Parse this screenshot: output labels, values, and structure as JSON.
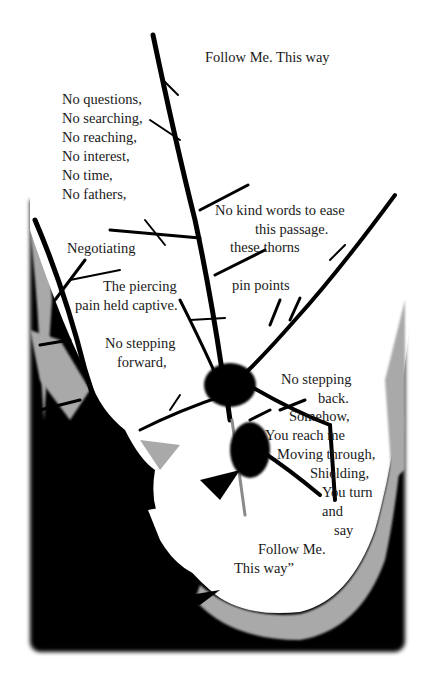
{
  "poem": {
    "title_line": "Follow Me. This way",
    "stanza_left": [
      "No questions,",
      "No searching,",
      "No reaching,",
      "No interest,",
      "No time,",
      "No fathers,"
    ],
    "kind_words": [
      "No kind words to  ease",
      "this passage."
    ],
    "these_thorns": "these thorns",
    "negotiating": "Negotiating",
    "piercing": [
      "The piercing",
      "pain held captive."
    ],
    "pin_points": "pin points",
    "stepping_forward": [
      "No stepping",
      "forward,"
    ],
    "stepping_back": [
      "No stepping",
      "back."
    ],
    "somehow": "Somehow,",
    "reach_me": "You reach me",
    "moving_through": "Moving through,",
    "shielding": "Shielding,",
    "you_turn": "You turn",
    "and": "and",
    "say": "say",
    "follow_me": "Follow Me.",
    "this_way_end": "This way”"
  },
  "colors": {
    "background": "#ffffff",
    "ink": "#000000",
    "shade_gray": "#a9a9a9",
    "text": "#1a1a1a"
  }
}
